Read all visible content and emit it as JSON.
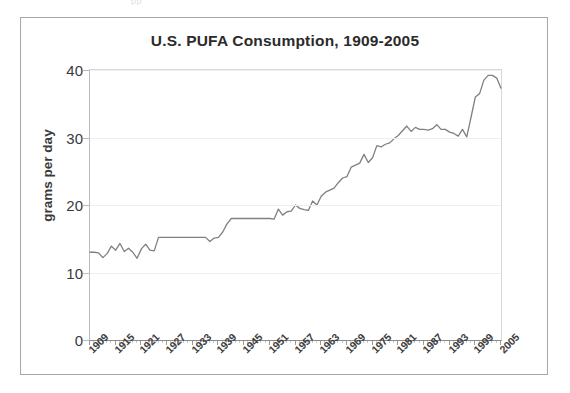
{
  "figure": {
    "title": "U.S. PUFA Consumption, 1909-2005",
    "top_artifact_text": "pp",
    "frame_color": "#a8a8a8",
    "background_color": "#ffffff"
  },
  "chart_data": {
    "type": "line",
    "title": "U.S. PUFA Consumption, 1909-2005",
    "xlabel": "",
    "ylabel": "grams per day",
    "xlim": [
      1909,
      2005
    ],
    "ylim": [
      0,
      40
    ],
    "yticks": [
      0,
      10,
      20,
      30,
      40
    ],
    "ytick_labels": [
      "0",
      "10",
      "20",
      "30",
      "40"
    ],
    "xticks": [
      1909,
      1915,
      1921,
      1927,
      1933,
      1939,
      1945,
      1951,
      1957,
      1963,
      1969,
      1975,
      1981,
      1987,
      1993,
      1999,
      2005
    ],
    "xtick_labels": [
      "1909",
      "1915",
      "1921",
      "1927",
      "1933",
      "1939",
      "1945",
      "1951",
      "1957",
      "1963",
      "1969",
      "1975",
      "1981",
      "1987",
      "1993",
      "1999",
      "2005"
    ],
    "grid": "horizontal",
    "legend": null,
    "line_color": "#808080",
    "line_width": 1.3,
    "series": [
      {
        "name": "U.S. PUFA consumption",
        "units": "grams per day",
        "x": [
          1909,
          1910,
          1911,
          1912,
          1913,
          1914,
          1915,
          1916,
          1917,
          1918,
          1919,
          1920,
          1921,
          1922,
          1923,
          1924,
          1925,
          1926,
          1927,
          1928,
          1929,
          1930,
          1931,
          1932,
          1933,
          1934,
          1935,
          1936,
          1937,
          1938,
          1939,
          1940,
          1941,
          1942,
          1943,
          1944,
          1945,
          1946,
          1947,
          1948,
          1949,
          1950,
          1951,
          1952,
          1953,
          1954,
          1955,
          1956,
          1957,
          1958,
          1959,
          1960,
          1961,
          1962,
          1963,
          1964,
          1965,
          1966,
          1967,
          1968,
          1969,
          1970,
          1971,
          1972,
          1973,
          1974,
          1975,
          1976,
          1977,
          1978,
          1979,
          1980,
          1981,
          1982,
          1983,
          1984,
          1985,
          1986,
          1987,
          1988,
          1989,
          1990,
          1991,
          1992,
          1993,
          1994,
          1995,
          1996,
          1997,
          1998,
          1999,
          2000,
          2001,
          2002,
          2003,
          2004,
          2005
        ],
        "values": [
          13.0,
          13.0,
          12.9,
          12.2,
          12.8,
          13.9,
          13.3,
          14.3,
          13.1,
          13.6,
          13.0,
          12.1,
          13.5,
          14.2,
          13.3,
          13.2,
          15.2,
          15.2,
          15.2,
          15.2,
          15.2,
          15.2,
          15.2,
          15.2,
          15.2,
          15.2,
          15.2,
          15.2,
          14.6,
          15.1,
          15.2,
          16.0,
          17.2,
          18.0,
          18.0,
          18.0,
          18.0,
          18.0,
          18.0,
          18.0,
          18.0,
          18.0,
          18.0,
          17.9,
          19.4,
          18.5,
          19.0,
          19.1,
          20.0,
          19.5,
          19.3,
          19.2,
          20.6,
          20.0,
          21.3,
          21.9,
          22.2,
          22.5,
          23.3,
          24.0,
          24.2,
          25.6,
          25.9,
          26.2,
          27.5,
          26.3,
          27.0,
          28.8,
          28.6,
          29.0,
          29.2,
          29.8,
          30.3,
          31.0,
          31.7,
          30.9,
          31.5,
          31.2,
          31.2,
          31.1,
          31.3,
          31.9,
          31.2,
          31.2,
          30.8,
          30.6,
          30.2,
          31.2,
          30.1,
          33.0,
          36.0,
          36.5,
          38.5,
          39.2,
          39.2,
          38.8,
          37.3
        ]
      }
    ]
  }
}
